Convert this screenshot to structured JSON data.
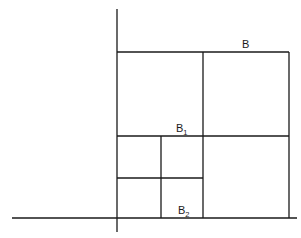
{
  "diagram": {
    "labels": {
      "outer": {
        "base": "B",
        "sub": ""
      },
      "mid": {
        "base": "B",
        "sub": "1"
      },
      "inner": {
        "base": "B",
        "sub": "2"
      }
    },
    "colors": {
      "line": "#1a1a1a",
      "background": "#ffffff"
    }
  }
}
